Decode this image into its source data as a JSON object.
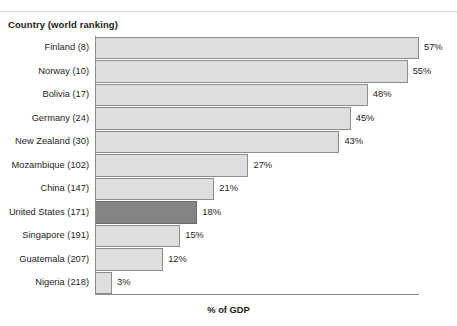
{
  "header": {
    "column_header": "Country (world ranking)"
  },
  "axis": {
    "x_title": "% of GDP"
  },
  "chart_data": {
    "type": "bar",
    "orientation": "horizontal",
    "title": "",
    "subtitle": "",
    "xlabel": "% of GDP",
    "ylabel": "Country (world ranking)",
    "xlim": [
      0,
      57
    ],
    "grid": false,
    "legend": null,
    "value_suffix": "%",
    "categories": [
      "Finland  (8)",
      "Norway  (10)",
      "Bolivia (17)",
      "Germany (24)",
      "New Zealand (30)",
      "Mozambique (102)",
      "China (147)",
      "United States  (171)",
      "Singapore (191)",
      "Guatemala (207)",
      "Nigeria (218)"
    ],
    "values": [
      57,
      55,
      48,
      45,
      43,
      27,
      21,
      18,
      15,
      12,
      3
    ],
    "value_labels": [
      "57%",
      "55%",
      "48%",
      "45%",
      "43%",
      "27%",
      "21%",
      "18%",
      "15%",
      "12%",
      "3%"
    ],
    "highlight_index": 7,
    "colors": {
      "bar_fill": "#dedede",
      "bar_border": "#8c8c8c",
      "highlight_fill": "#848484",
      "highlight_border": "#6b6b6b",
      "text": "#1d1d1d",
      "background": "#ffffff"
    }
  }
}
